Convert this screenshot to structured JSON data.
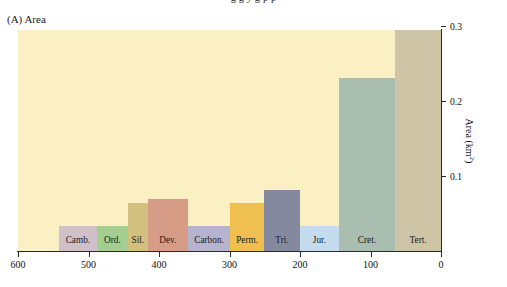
{
  "page": {
    "cropped_caption_line": "g g y g p p",
    "panel_title": "(A) Area"
  },
  "axes": {
    "y_title": "Area (km",
    "y_title_exp": "2",
    "y_title_close": ")",
    "y_ticks": [
      "0.1",
      "0.2",
      "0.3"
    ],
    "x_ticks": [
      "600",
      "500",
      "400",
      "300",
      "200",
      "100",
      "0"
    ]
  },
  "chart_data": {
    "type": "bar",
    "title": "(A) Area",
    "xlabel": "",
    "ylabel": "Area (km2)",
    "xlim": [
      600,
      0
    ],
    "ylim": [
      0,
      0.33
    ],
    "x_reversed": true,
    "grid": false,
    "legend": "none",
    "categories": [
      "Camb.",
      "Ord.",
      "Sil.",
      "Dev.",
      "Carbon.",
      "Perm.",
      "Tri.",
      "Jur.",
      "Cret.",
      "Tert."
    ],
    "x_ranges_ma": [
      [
        542,
        488
      ],
      [
        488,
        444
      ],
      [
        444,
        416
      ],
      [
        416,
        359
      ],
      [
        359,
        299
      ],
      [
        299,
        251
      ],
      [
        251,
        200
      ],
      [
        200,
        145
      ],
      [
        145,
        65
      ],
      [
        65,
        0
      ]
    ],
    "values": [
      0.033,
      0.033,
      0.064,
      0.069,
      0.033,
      0.064,
      0.082,
      0.033,
      0.231,
      0.295
    ],
    "colors": [
      "#cfc0ca",
      "#a4ce8f",
      "#d2c07e",
      "#d69c85",
      "#b5b3cd",
      "#efc04f",
      "#8589a0",
      "#c5dcee",
      "#a9bdb0",
      "#cdc5a6"
    ],
    "plot_background": "#faf0c3",
    "note": "Bar heights read from right-hand axis; label band height (0.033) is the minimum drawn band for every period."
  }
}
